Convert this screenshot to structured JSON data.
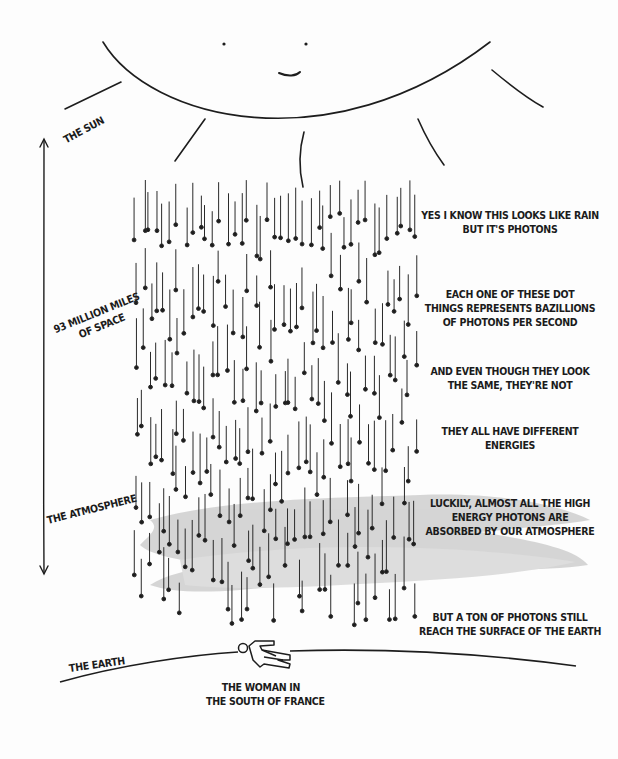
{
  "labels": {
    "sun": "THE SUN",
    "distance_line1": "93 MILLION MILES",
    "distance_line2": "OF SPACE",
    "atmosphere": "THE ATMOSPHERE",
    "earth": "THE EARTH",
    "woman_line1": "THE WOMAN IN",
    "woman_line2": "THE SOUTH OF FRANCE"
  },
  "notes": [
    {
      "line1": "YES I KNOW THIS LOOKS LIKE RAIN",
      "line2": "BUT IT'S PHOTONS"
    },
    {
      "line1": "EACH ONE OF THESE DOT",
      "line2": "THINGS REPRESENTS BAZILLIONS",
      "line3": "OF PHOTONS PER SECOND"
    },
    {
      "line1": "AND EVEN THOUGH THEY LOOK",
      "line2": "THE SAME, THEY'RE NOT"
    },
    {
      "line1": "THEY ALL HAVE DIFFERENT",
      "line2": "ENERGIES"
    },
    {
      "line1": "LUCKILY, ALMOST ALL THE HIGH",
      "line2": "ENERGY PHOTONS ARE",
      "line3": "ABSORBED BY OUR ATMOSPHERE"
    },
    {
      "line1": "BUT A TON OF PHOTONS STILL",
      "line2": "REACH THE SURFACE OF THE EARTH"
    }
  ],
  "colors": {
    "ink": "#1d1d1d",
    "atmosphere": "#c9c9c9",
    "background": "#fdfdfd"
  }
}
